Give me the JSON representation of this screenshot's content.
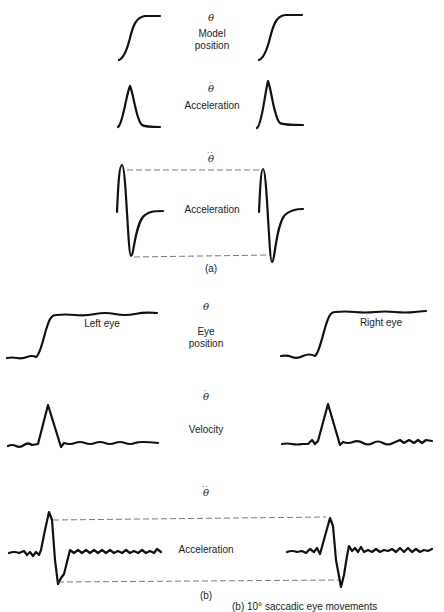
{
  "figure": {
    "panel_a": {
      "label": "(a)",
      "rows": [
        {
          "symbol": "θ",
          "dots": "",
          "label_lines": [
            "Model",
            "position"
          ]
        },
        {
          "symbol": "θ",
          "dots": "·",
          "label_lines": [
            "Velocity"
          ]
        },
        {
          "symbol": "θ",
          "dots": "··",
          "label_lines": [
            "Acceleration"
          ]
        }
      ]
    },
    "panel_b": {
      "label": "(b)",
      "rows": [
        {
          "symbol": "θ",
          "dots": "",
          "label_lines": [
            "Eye",
            "position"
          ],
          "left_trace_label": "Left eye",
          "right_trace_label": "Right eye"
        },
        {
          "symbol": "θ",
          "dots": "·",
          "label_lines": [
            "Velocity"
          ]
        },
        {
          "symbol": "θ",
          "dots": "··",
          "label_lines": [
            "Acceleration"
          ]
        }
      ]
    },
    "caption_fragment": "(b) 10° saccadic eye movements"
  }
}
